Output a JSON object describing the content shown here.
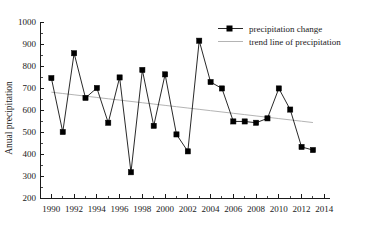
{
  "chart_data": {
    "type": "line",
    "title": "",
    "xlabel": "",
    "ylabel": "Anual precipitation",
    "xlim": [
      1989,
      2014.5
    ],
    "ylim": [
      200,
      1000
    ],
    "grid": false,
    "legend_position": "top-right",
    "x_ticks": [
      "1990",
      "1992",
      "1994",
      "1996",
      "1998",
      "2000",
      "2002",
      "2004",
      "2006",
      "2008",
      "2010",
      "2012",
      "2014"
    ],
    "y_ticks": [
      "200",
      "300",
      "400",
      "500",
      "600",
      "700",
      "800",
      "900",
      "1000"
    ],
    "x": [
      1990,
      1991,
      1992,
      1993,
      1994,
      1995,
      1996,
      1997,
      1998,
      1999,
      2000,
      2001,
      2002,
      2003,
      2004,
      2005,
      2006,
      2007,
      2008,
      2009,
      2010,
      2011,
      2012,
      2013
    ],
    "series": [
      {
        "name": "precipitation change",
        "marker": "square",
        "color": "#000000",
        "values": [
          745,
          500,
          858,
          655,
          700,
          542,
          748,
          317,
          782,
          528,
          762,
          489,
          412,
          915,
          727,
          698,
          548,
          548,
          542,
          562,
          698,
          602,
          432,
          418
        ]
      },
      {
        "name": "trend line of precipitation",
        "marker": "none",
        "color": "#b4b4b4",
        "values": [
          681,
          675,
          669,
          663,
          657,
          651,
          645,
          639,
          633,
          627,
          621,
          615,
          609,
          603,
          597,
          591,
          585,
          579,
          573,
          567,
          561,
          555,
          549,
          543
        ]
      }
    ]
  },
  "legend": {
    "entries": [
      {
        "label": "precipitation change"
      },
      {
        "label": "trend line of precipitation"
      }
    ]
  }
}
